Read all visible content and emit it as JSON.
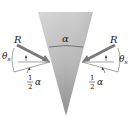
{
  "figure": {
    "type": "wedge-force-diagram",
    "wedge_angle_label": "α",
    "left": {
      "force_label": "R",
      "angle_label": "θ",
      "angle_subscript": "s",
      "half_angle_numerator": "1",
      "half_angle_denominator": "2",
      "half_angle_symbol": "α"
    },
    "right": {
      "force_label": "R",
      "angle_label": "θ",
      "angle_subscript": "s",
      "half_angle_numerator": "1",
      "half_angle_denominator": "2",
      "half_angle_symbol": "α"
    }
  },
  "colors": {
    "wedge_light": "#d6d6d6",
    "wedge_dark": "#8a8a8a",
    "arrow": "#7a7a7a",
    "line": "#555555",
    "text": "#222222"
  }
}
